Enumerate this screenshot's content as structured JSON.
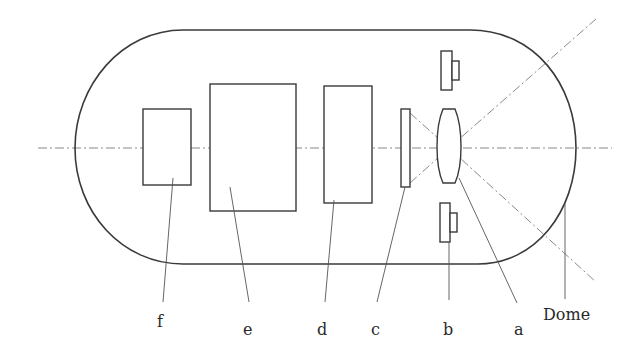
{
  "diagram": {
    "type": "optical-system-schematic",
    "housing": {
      "shape": "capsule",
      "dome_label": "Dome"
    },
    "components": [
      {
        "id": "a",
        "label": "a",
        "shape": "biconvex-lens"
      },
      {
        "id": "b",
        "label": "b",
        "shape": "bracket-pair"
      },
      {
        "id": "c",
        "label": "c",
        "shape": "thin-plate"
      },
      {
        "id": "d",
        "label": "d",
        "shape": "rectangle"
      },
      {
        "id": "e",
        "label": "e",
        "shape": "rectangle"
      },
      {
        "id": "f",
        "label": "f",
        "shape": "rectangle"
      }
    ],
    "labels": {
      "f": "f",
      "e": "e",
      "d": "d",
      "c": "c",
      "b": "b",
      "a": "a",
      "dome": "Dome"
    },
    "lines": {
      "optical_axis": "dash-dot horizontal",
      "field_of_view": "dash-dot diagonals crossing at lens"
    }
  }
}
